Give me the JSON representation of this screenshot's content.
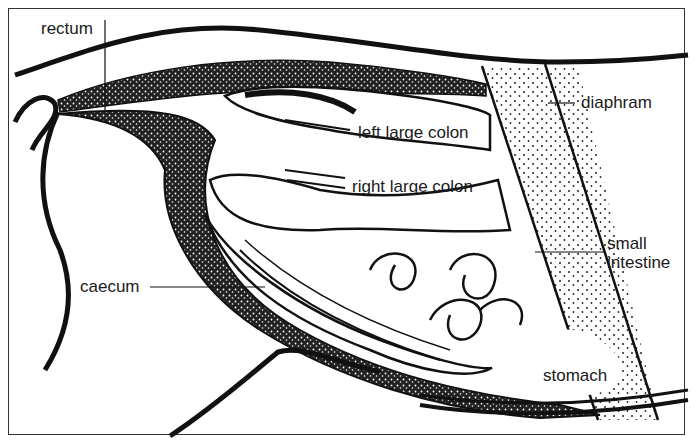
{
  "figure": {
    "colors": {
      "ink": "#111111",
      "paper": "#ffffff",
      "text": "#1a1a1a"
    },
    "labels": {
      "rectum": "rectum",
      "left_large_colon": "left large colon",
      "right_large_colon": "right large colon",
      "diaphram": "diaphram",
      "small_intestine_line1": "small",
      "small_intestine_line2": "intestine",
      "caecum": "caecum",
      "stomach": "stomach"
    }
  }
}
